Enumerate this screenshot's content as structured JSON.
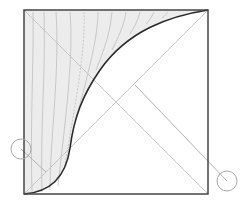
{
  "diagram": {
    "type": "geometric-construction",
    "colors": {
      "background": "#ffffff",
      "square_border": "#444444",
      "diagonal": "#c4c4c4",
      "curve": "#2a2a2a",
      "shade_fill": "#ececec",
      "streamline": "#b8b8b8",
      "marker_circle": "#a8a8a8"
    },
    "square": {
      "x": 24,
      "y": 10,
      "size": 184
    },
    "markers": [
      {
        "name": "left-marker",
        "cx": 21,
        "cy": 149,
        "r": 10
      },
      {
        "name": "right-marker",
        "cx": 227,
        "cy": 181,
        "r": 10
      }
    ]
  }
}
